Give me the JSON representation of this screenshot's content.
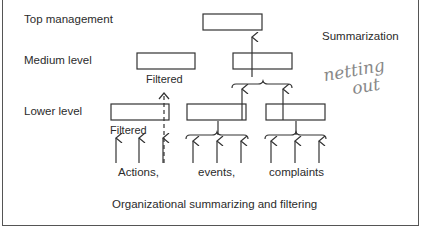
{
  "diagram": {
    "levels": {
      "top": "Top management",
      "medium": "Medium level",
      "lower": "Lower level"
    },
    "annotations": {
      "summarization": "Summarization",
      "filtered_medium": "Filtered",
      "filtered_lower": "Filtered",
      "handwritten_line1": "netting",
      "handwritten_line2": "out"
    },
    "inputs": {
      "actions": "Actions,",
      "events": "events,",
      "complaints": "complaints"
    },
    "caption": "Organizational summarizing and filtering",
    "colors": {
      "line": "#333333",
      "handwriting": "#888888"
    }
  }
}
